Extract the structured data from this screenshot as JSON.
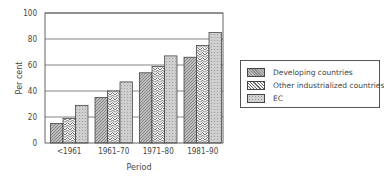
{
  "chart_data": {
    "type": "bar",
    "title": "",
    "xlabel": "Period",
    "ylabel": "Per cent",
    "ylim": [
      0,
      100
    ],
    "yticks": [
      0,
      20,
      40,
      60,
      80,
      100
    ],
    "grid": true,
    "legend_position": "right",
    "categories": [
      "<1961",
      "1961–70",
      "1971–80",
      "1981–90"
    ],
    "series": [
      {
        "name": "Developing countries",
        "values": [
          15,
          35,
          54,
          66
        ]
      },
      {
        "name": "Other industrialized countries",
        "values": [
          19,
          40,
          59,
          75
        ]
      },
      {
        "name": "EC",
        "values": [
          29,
          47,
          67,
          85
        ]
      }
    ]
  },
  "legend": {
    "items": [
      {
        "label": "Developing countries"
      },
      {
        "label": "Other industrialized countries"
      },
      {
        "label": "EC"
      }
    ]
  }
}
